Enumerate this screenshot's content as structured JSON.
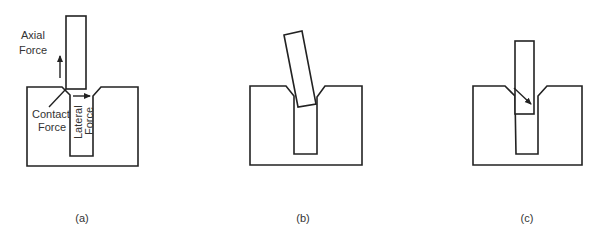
{
  "figure": {
    "panels": [
      {
        "id": "a",
        "caption": "(a)",
        "labels": {
          "axial_force": [
            "Axial",
            "Force"
          ],
          "contact_force": [
            "Contact",
            "Force"
          ],
          "lateral_force": [
            "Lateral",
            "Force"
          ]
        }
      },
      {
        "id": "b",
        "caption": "(b)"
      },
      {
        "id": "c",
        "caption": "(c)"
      }
    ],
    "colors": {
      "stroke": "#222222",
      "text": "#333333",
      "background": "#ffffff"
    }
  }
}
